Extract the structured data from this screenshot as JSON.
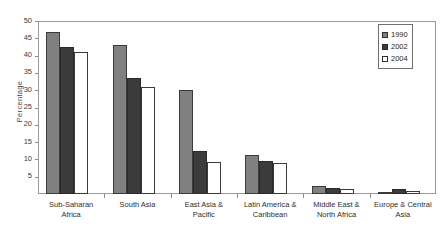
{
  "chart_data": {
    "type": "bar",
    "title": "",
    "xlabel": "",
    "ylabel": "Percentage",
    "ylim": [
      0,
      50
    ],
    "yticks": [
      0,
      5,
      10,
      15,
      20,
      25,
      30,
      35,
      40,
      45,
      50
    ],
    "ytick_labels": [
      "",
      "5",
      "10",
      "15",
      "20",
      "25",
      "30",
      "35",
      "40",
      "45",
      "50"
    ],
    "grid": false,
    "legend_position": "top-right-inside",
    "categories": [
      "Sub-Saharan\nAfrica",
      "South Asia",
      "East Asia &\nPacific",
      "Latin America &\nCaribbean",
      "Middle East &\nNorth Africa",
      "Europe & Central\nAsia"
    ],
    "series": [
      {
        "name": "1990",
        "color": "#808080",
        "values": [
          46.8,
          43.0,
          30.0,
          11.3,
          2.3,
          0.7
        ]
      },
      {
        "name": "2002",
        "color": "#3b3b3b",
        "values": [
          42.6,
          33.5,
          12.3,
          9.5,
          1.6,
          1.5
        ]
      },
      {
        "name": "2004",
        "color": "#ffffff",
        "values": [
          41.0,
          31.0,
          9.3,
          8.9,
          1.5,
          0.8
        ]
      }
    ]
  },
  "legend": {
    "items": [
      {
        "label": "1990"
      },
      {
        "label": "2002"
      },
      {
        "label": "2004"
      }
    ]
  },
  "axis": {
    "y_title": "Percentage"
  }
}
